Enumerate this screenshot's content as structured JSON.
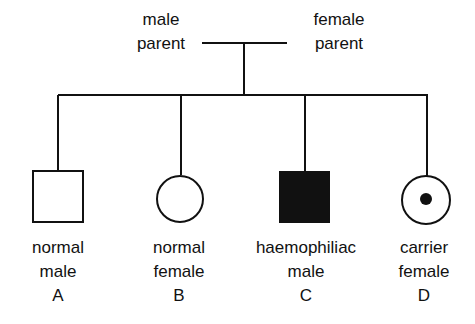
{
  "parents": {
    "male_line1": "male",
    "male_line2": "parent",
    "female_line1": "female",
    "female_line2": "parent"
  },
  "offspring": [
    {
      "line1": "normal",
      "line2": "male",
      "letter": "A",
      "symbol": "square",
      "fill": "empty"
    },
    {
      "line1": "normal",
      "line2": "female",
      "letter": "B",
      "symbol": "circle",
      "fill": "empty"
    },
    {
      "line1": "haemophiliac",
      "line2": "male",
      "letter": "C",
      "symbol": "square",
      "fill": "solid"
    },
    {
      "line1": "carrier",
      "line2": "female",
      "letter": "D",
      "symbol": "circle",
      "fill": "dot"
    }
  ]
}
